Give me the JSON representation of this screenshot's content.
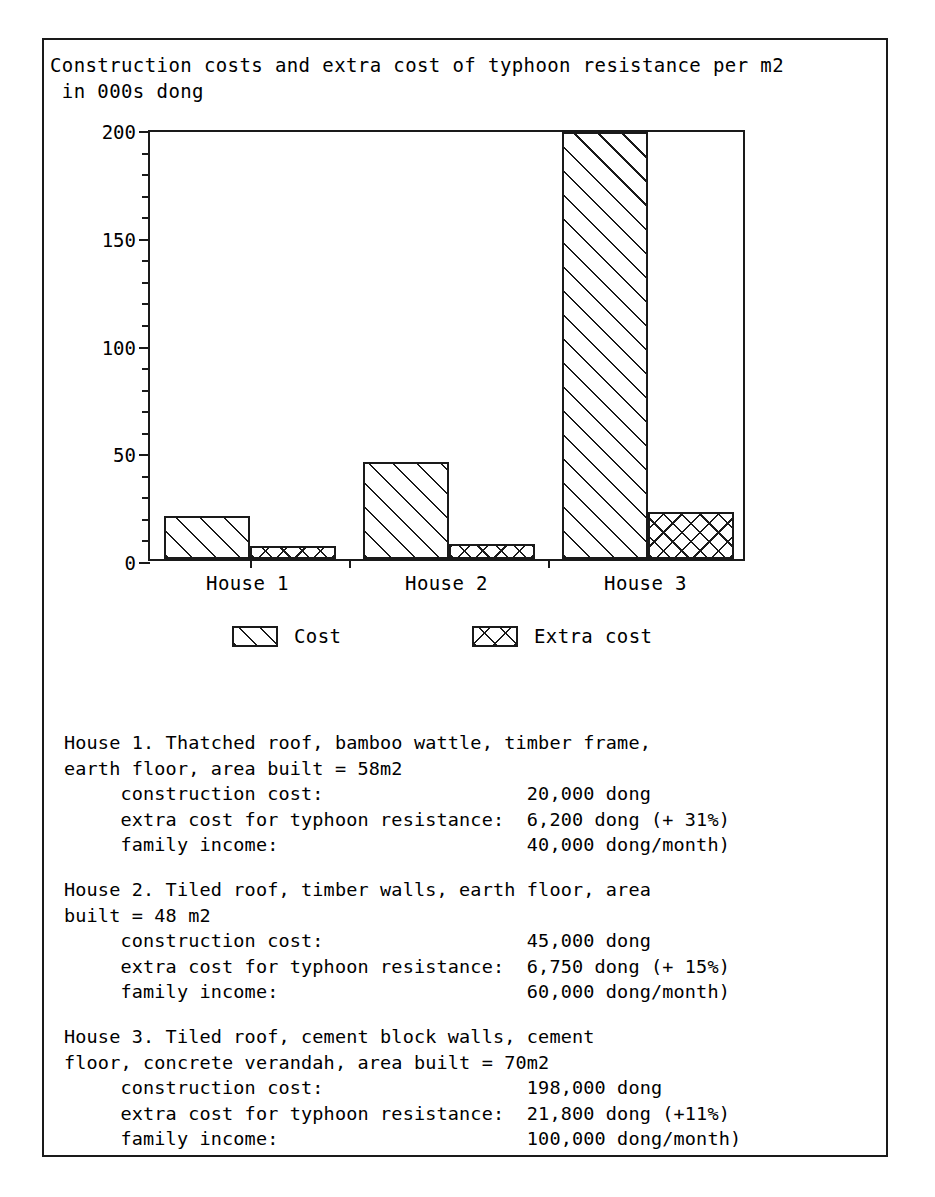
{
  "chart_title": "Construction costs and extra cost of typhoon resistance per m2\n in 000s dong",
  "chart_data": {
    "type": "bar",
    "title": "Construction costs and extra cost of typhoon resistance per m2 in 000s dong",
    "xlabel": "",
    "ylabel": "",
    "ylim": [
      0,
      200
    ],
    "ytick_labels": [
      "0",
      "50",
      "100",
      "150",
      "200"
    ],
    "ytick_values": [
      0,
      50,
      100,
      150,
      200
    ],
    "yminor_step": 10,
    "grid": false,
    "legend_position": "below-axes",
    "categories": [
      "House 1",
      "House 2",
      "House 3"
    ],
    "series": [
      {
        "name": "Cost",
        "pattern": "diagonal-hatch",
        "values": [
          20,
          45,
          198
        ]
      },
      {
        "name": "Extra cost",
        "pattern": "cross-hatch",
        "values": [
          6.2,
          6.75,
          21.8
        ]
      }
    ]
  },
  "legend": {
    "items": [
      {
        "label": "Cost",
        "pattern": "diagonal-hatch"
      },
      {
        "label": "Extra cost",
        "pattern": "cross-hatch"
      }
    ]
  },
  "axis": {
    "y_labels": [
      "200",
      "150",
      "100",
      "50",
      "0"
    ],
    "x_labels": [
      "House 1",
      "House 2",
      "House 3"
    ]
  },
  "descriptions": [
    {
      "id": "house-1",
      "lines": [
        "House 1. Thatched roof, bamboo wattle, timber frame,",
        "earth floor, area built = 58m2",
        "     construction cost:                  20,000 dong",
        "     extra cost for typhoon resistance:  6,200 dong (+ 31%)",
        "     family income:                      40,000 dong/month)"
      ]
    },
    {
      "id": "house-2",
      "lines": [
        "House 2. Tiled roof, timber walls, earth floor, area",
        "built = 48 m2",
        "     construction cost:                  45,000 dong",
        "     extra cost for typhoon resistance:  6,750 dong (+ 15%)",
        "     family income:                      60,000 dong/month)"
      ]
    },
    {
      "id": "house-3",
      "lines": [
        "House 3. Tiled roof, cement block walls, cement",
        "floor, concrete verandah, area built = 70m2",
        "     construction cost:                  198,000 dong",
        "     extra cost for typhoon resistance:  21,800 dong (+11%)",
        "     family income:                      100,000 dong/month)"
      ]
    }
  ]
}
